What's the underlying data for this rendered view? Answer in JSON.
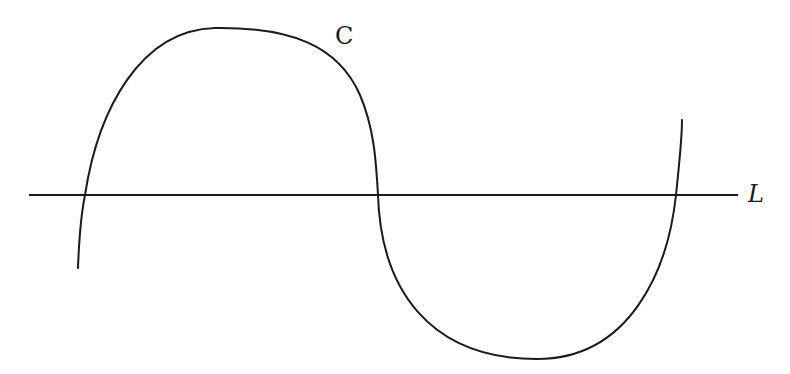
{
  "diagram": {
    "curve": {
      "label": "C",
      "color": "#1a1a1a",
      "key_points": [
        {
          "x": 78,
          "y": 268
        },
        {
          "x": 85,
          "y": 195
        },
        {
          "x": 215,
          "y": 28
        },
        {
          "x": 378,
          "y": 195
        },
        {
          "x": 537,
          "y": 359
        },
        {
          "x": 676,
          "y": 195
        },
        {
          "x": 682,
          "y": 120
        }
      ],
      "intersections_with_line": 3
    },
    "line": {
      "label": "L",
      "color": "#1a1a1a",
      "x_start": 29,
      "x_end": 738,
      "y": 195
    }
  }
}
